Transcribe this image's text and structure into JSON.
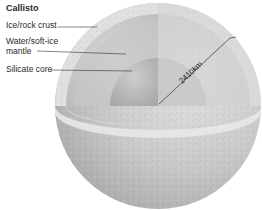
{
  "title": "Callisto",
  "labels": {
    "crust": "Ice/rock crust",
    "mantle_line1": "Water/soft-ice",
    "mantle_line2": "mantle",
    "core": "Silicate core"
  },
  "measurement": {
    "radius_label": "2410km"
  },
  "colors": {
    "sphere_surface": "#c9c9c9",
    "crust": "#e2e2e2",
    "mantle": "#cfcfcf",
    "core": "#bdbdbd",
    "leader_line": "#333333"
  }
}
